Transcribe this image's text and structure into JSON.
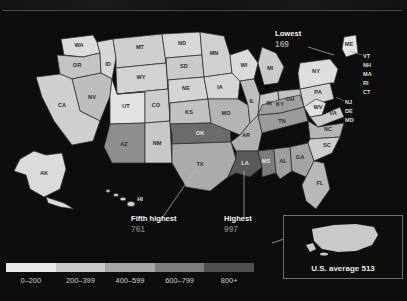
{
  "header": {
    "title_partial": ""
  },
  "map": {
    "kind": "choropleth-us-states",
    "state_labels": [
      {
        "code": "WA"
      },
      {
        "code": "OR"
      },
      {
        "code": "ID"
      },
      {
        "code": "MT"
      },
      {
        "code": "ND"
      },
      {
        "code": "MN"
      },
      {
        "code": "WI"
      },
      {
        "code": "MI"
      },
      {
        "code": "NY"
      },
      {
        "code": "ME"
      },
      {
        "code": "WY"
      },
      {
        "code": "SD"
      },
      {
        "code": "IA"
      },
      {
        "code": "NV"
      },
      {
        "code": "UT"
      },
      {
        "code": "CO"
      },
      {
        "code": "NE"
      },
      {
        "code": "KS"
      },
      {
        "code": "MO"
      },
      {
        "code": "IL"
      },
      {
        "code": "IN"
      },
      {
        "code": "OH"
      },
      {
        "code": "PA"
      },
      {
        "code": "CA"
      },
      {
        "code": "AZ"
      },
      {
        "code": "NM"
      },
      {
        "code": "OK"
      },
      {
        "code": "TX"
      },
      {
        "code": "AR"
      },
      {
        "code": "LA"
      },
      {
        "code": "MS"
      },
      {
        "code": "AL"
      },
      {
        "code": "GA"
      },
      {
        "code": "FL"
      },
      {
        "code": "TN"
      },
      {
        "code": "KY"
      },
      {
        "code": "WV"
      },
      {
        "code": "VA"
      },
      {
        "code": "NC"
      },
      {
        "code": "SC"
      },
      {
        "code": "AK"
      },
      {
        "code": "HI"
      }
    ],
    "edge_labels": [
      "VT",
      "NH",
      "MA",
      "RI",
      "CT",
      "NJ",
      "DE",
      "MD"
    ]
  },
  "callouts": {
    "lowest": {
      "title": "Lowest",
      "value": "169"
    },
    "fifth_highest": {
      "title": "Fifth highest",
      "value": "761"
    },
    "highest": {
      "title": "Highest",
      "value": "997"
    }
  },
  "legend": {
    "bands": [
      {
        "label": "0–200",
        "color": "#e9e9e9"
      },
      {
        "label": "200–399",
        "color": "#c9c9c9"
      },
      {
        "label": "400–599",
        "color": "#a6a6a6"
      },
      {
        "label": "600–799",
        "color": "#7d7d7d"
      },
      {
        "label": "800+",
        "color": "#4f4f4f"
      }
    ]
  },
  "inset": {
    "caption": "U.S. average 513"
  },
  "colors": {
    "background": "#0d0d0e",
    "water": "#0d0d0e",
    "stroke": "#2a2a2a",
    "text": "#e8e8e8"
  }
}
